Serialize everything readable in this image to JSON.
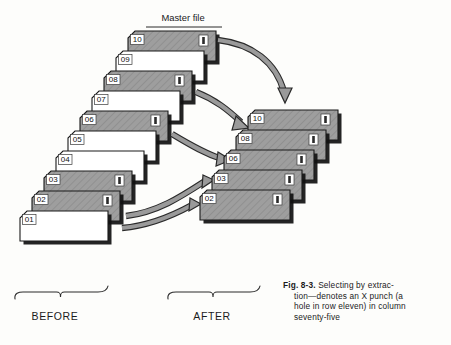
{
  "figure": {
    "master_file_label": "Master file",
    "before_label": "BEFORE",
    "after_label": "AFTER",
    "caption_number": "Fig. 8-3.",
    "caption_line1": "Selecting by extrac-",
    "caption_line2": "tion—denotes an X punch (a",
    "caption_line3": "hole in row eleven) in column",
    "caption_line4": "seventy-five",
    "caption_full": "Fig. 8-3. Selecting by extraction—denotes an X punch (a hole in row eleven) in column seventy-five"
  },
  "colors": {
    "card_shaded_fill": "#9e9e9e",
    "card_plain_fill": "#ffffff",
    "card_outline": "#1a1a1a",
    "card_shadow": "#111111",
    "arrow_fill": "#9a9a9a",
    "arrow_outline": "#2a2a2a",
    "punch_box_fill": "#ffffff",
    "punch_slot_fill": "#2b2b2b",
    "text": "#1b1b1b",
    "background": "#fdfdfb"
  },
  "before_stack": {
    "name": "BEFORE",
    "cards": [
      {
        "label": "10",
        "punched": true,
        "x": 128,
        "y": 31,
        "w": 88,
        "h": 30
      },
      {
        "label": "09",
        "punched": false,
        "x": 116,
        "y": 51,
        "w": 88,
        "h": 30
      },
      {
        "label": "08",
        "punched": true,
        "x": 104,
        "y": 71,
        "w": 88,
        "h": 30
      },
      {
        "label": "07",
        "punched": false,
        "x": 92,
        "y": 91,
        "w": 88,
        "h": 30
      },
      {
        "label": "06",
        "punched": true,
        "x": 80,
        "y": 111,
        "w": 88,
        "h": 30
      },
      {
        "label": "05",
        "punched": false,
        "x": 68,
        "y": 131,
        "w": 88,
        "h": 30
      },
      {
        "label": "04",
        "punched": false,
        "x": 56,
        "y": 151,
        "w": 88,
        "h": 30
      },
      {
        "label": "03",
        "punched": true,
        "x": 44,
        "y": 171,
        "w": 88,
        "h": 30
      },
      {
        "label": "02",
        "punched": true,
        "x": 32,
        "y": 191,
        "w": 88,
        "h": 30
      },
      {
        "label": "01",
        "punched": false,
        "x": 20,
        "y": 211,
        "w": 88,
        "h": 30
      }
    ]
  },
  "after_stack": {
    "name": "AFTER",
    "cards": [
      {
        "label": "10",
        "punched": true,
        "x": 248,
        "y": 110,
        "w": 90,
        "h": 30
      },
      {
        "label": "08",
        "punched": true,
        "x": 236,
        "y": 130,
        "w": 90,
        "h": 30
      },
      {
        "label": "06",
        "punched": true,
        "x": 224,
        "y": 150,
        "w": 90,
        "h": 30
      },
      {
        "label": "03",
        "punched": true,
        "x": 212,
        "y": 170,
        "w": 90,
        "h": 30
      },
      {
        "label": "02",
        "punched": true,
        "x": 200,
        "y": 190,
        "w": 90,
        "h": 30
      }
    ]
  },
  "arrows": [
    {
      "name": "arrow-10",
      "from_card": "10",
      "to_card": "10"
    },
    {
      "name": "arrow-08",
      "from_card": "08",
      "to_card": "08"
    },
    {
      "name": "arrow-06",
      "from_card": "06",
      "to_card": "06"
    },
    {
      "name": "arrow-03",
      "from_card": "03",
      "to_card": "03"
    },
    {
      "name": "arrow-02",
      "from_card": "02",
      "to_card": "02"
    }
  ],
  "braces": {
    "before": {
      "x1": 15,
      "x2": 106,
      "y": 292,
      "label_x": 55,
      "label_y": 317
    },
    "after": {
      "x1": 168,
      "x2": 258,
      "y": 292,
      "label_x": 212,
      "label_y": 317
    }
  }
}
